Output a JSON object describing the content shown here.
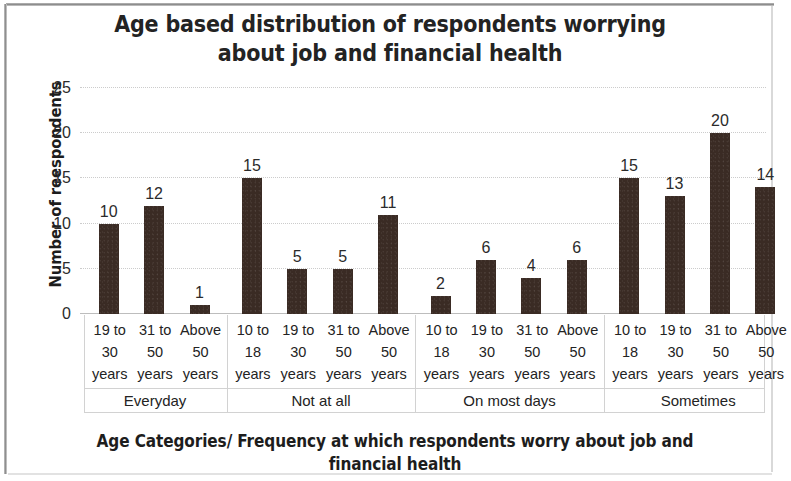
{
  "chart_data": {
    "type": "bar",
    "title": "Age based distribution of respondents worrying\nabout job and financial health",
    "xlabel": "Age Categories/ Frequency at which respondents worry about job and\nfinancial health",
    "ylabel": "Number of reespondents",
    "ylim": [
      0,
      25
    ],
    "yticks": [
      0,
      5,
      10,
      15,
      20,
      25
    ],
    "ytick_labels": [
      "0",
      "5",
      "10",
      "15",
      "20",
      "25"
    ],
    "grid": true,
    "legend": "none",
    "bar_color": "#3a2b24",
    "groups": [
      {
        "name": "Everyday",
        "categories": [
          "19 to\n30\nyears",
          "31 to\n50\nyears",
          "Above\n50\nyears"
        ],
        "values": [
          10,
          12,
          1
        ]
      },
      {
        "name": "Not at all",
        "categories": [
          "10 to\n18\nyears",
          "19 to\n30\nyears",
          "31 to\n50\nyears",
          "Above\n50\nyears"
        ],
        "values": [
          15,
          5,
          5,
          11
        ]
      },
      {
        "name": "On most days",
        "categories": [
          "10 to\n18\nyears",
          "19 to\n30\nyears",
          "31 to\n50\nyears",
          "Above\n50\nyears"
        ],
        "values": [
          2,
          6,
          4,
          6
        ]
      },
      {
        "name": "Sometimes",
        "categories": [
          "10 to\n18\nyears",
          "19 to\n30\nyears",
          "31 to\n50\nyears",
          "Above\n50\nyears"
        ],
        "values": [
          15,
          13,
          20,
          14
        ]
      }
    ],
    "categories": [
      "19 to 30 years",
      "31 to 50 years",
      "Above 50 years",
      "10 to 18 years",
      "19 to 30 years",
      "31 to 50 years",
      "Above 50 years",
      "10 to 18 years",
      "19 to 30 years",
      "31 to 50 years",
      "Above 50 years",
      "10 to 18 years",
      "19 to 30 years",
      "31 to 50 years",
      "Above 50 years"
    ],
    "values": [
      10,
      12,
      1,
      15,
      5,
      5,
      11,
      2,
      6,
      4,
      6,
      15,
      13,
      20,
      14
    ],
    "data_labels": [
      "10",
      "12",
      "1",
      "15",
      "5",
      "5",
      "11",
      "2",
      "6",
      "4",
      "6",
      "15",
      "13",
      "20",
      "14"
    ]
  }
}
